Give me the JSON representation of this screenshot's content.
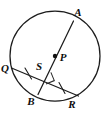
{
  "figure": {
    "kind": "geometry-diagram",
    "background_color": "#ffffff",
    "stroke_color": "#1c1c1c",
    "label_color": "#0d0d0d",
    "circle": {
      "center_label": "P",
      "center_x": 55,
      "center_y": 56,
      "radius": 45
    },
    "points": [
      {
        "id": "A",
        "label": "A",
        "label_x": 78,
        "label_y": 13,
        "on_x": 72.5,
        "on_y": 22.5
      },
      {
        "id": "P",
        "label": "P",
        "label_x": 63,
        "label_y": 58,
        "on_x": 55,
        "on_y": 56
      },
      {
        "id": "Q",
        "label": "Q",
        "label_x": 5,
        "label_y": 69,
        "on_x": 12.5,
        "on_y": 68.5
      },
      {
        "id": "S",
        "label": "S",
        "label_x": 39,
        "label_y": 67,
        "on_x": 46,
        "on_y": 74.5
      },
      {
        "id": "B",
        "label": "B",
        "label_x": 31,
        "label_y": 102,
        "on_x": 38.5,
        "on_y": 93.5
      },
      {
        "id": "R",
        "label": "R",
        "label_x": 72,
        "label_y": 105,
        "on_x": 78,
        "on_y": 95.5
      }
    ],
    "segments": [
      {
        "id": "AB",
        "from": "A",
        "to": "B",
        "note": "diameter-line through center P"
      },
      {
        "id": "QR",
        "from": "Q",
        "to": "R",
        "note": "chord crossing AB at S"
      }
    ],
    "tick_marks": [
      {
        "id": "tick-QS",
        "on_segment": "QS",
        "count": 1
      },
      {
        "id": "tick-SR",
        "on_segment": "SR",
        "count": 1
      }
    ],
    "right_angle": {
      "id": "right-angle-at-S",
      "vertex": "S",
      "size": 8,
      "note": "square marker showing AB perpendicular to QR"
    }
  }
}
